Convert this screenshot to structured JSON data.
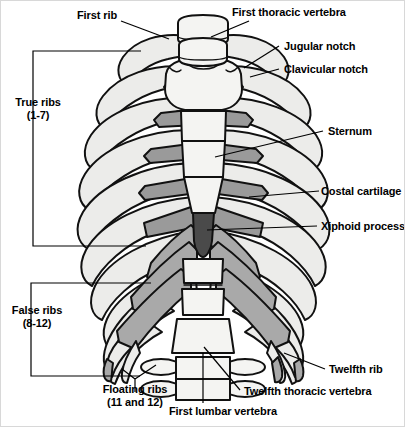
{
  "figure": {
    "background": "#ffffff",
    "border_color": "#d8d8d8"
  },
  "colors": {
    "outline": "#111111",
    "bone_fill": "#ececea",
    "bone_fill_light": "#f4f4f2",
    "cartilage_fill": "#a9a9a9",
    "cartilage_fill_dark": "#9a9a9a",
    "xiphoid_fill": "#4a4a4a",
    "leader_line": "#000000",
    "text": "#000000"
  },
  "labels": [
    {
      "id": "first-rib",
      "text": "First rib",
      "x": 76,
      "y": 8,
      "align": "left",
      "lines": [
        "First rib"
      ]
    },
    {
      "id": "first-thoracic-vertebra",
      "text": "First thoracic vertebra",
      "x": 231,
      "y": 5,
      "align": "left",
      "lines": [
        "First thoracic vertebra"
      ]
    },
    {
      "id": "jugular-notch",
      "text": "Jugular notch",
      "x": 283,
      "y": 39,
      "align": "left",
      "lines": [
        "Jugular notch"
      ]
    },
    {
      "id": "clavicular-notch",
      "text": "Clavicular notch",
      "x": 283,
      "y": 62,
      "align": "left",
      "lines": [
        "Clavicular notch"
      ]
    },
    {
      "id": "true-ribs",
      "text": "True ribs (1-7)",
      "x": 6,
      "y": 95,
      "align": "left",
      "lines": [
        "True ribs",
        "(1-7)"
      ]
    },
    {
      "id": "sternum",
      "text": "Sternum",
      "x": 327,
      "y": 124,
      "align": "left",
      "lines": [
        "Sternum"
      ]
    },
    {
      "id": "costal-cartilage",
      "text": "Costal cartilage",
      "x": 320,
      "y": 184,
      "align": "left",
      "lines": [
        "Costal cartilage"
      ]
    },
    {
      "id": "xiphoid-process",
      "text": "Xiphoid process",
      "x": 320,
      "y": 219,
      "align": "left",
      "lines": [
        "Xiphoid process"
      ]
    },
    {
      "id": "false-ribs",
      "text": "False ribs (8-12)",
      "x": 3,
      "y": 303,
      "align": "left",
      "lines": [
        "False ribs",
        "(8-12)"
      ]
    },
    {
      "id": "twelfth-rib",
      "text": "Twelfth rib",
      "x": 328,
      "y": 362,
      "align": "left",
      "lines": [
        "Twelfth rib"
      ]
    },
    {
      "id": "floating-ribs",
      "text": "Floating ribs (11 and 12)",
      "x": 82,
      "y": 382,
      "align": "left",
      "lines": [
        "Floating ribs",
        "(11 and 12)"
      ]
    },
    {
      "id": "twelfth-thoracic-vertebra",
      "text": "Twelfth thoracic vertebra",
      "x": 243,
      "y": 384,
      "align": "left",
      "lines": [
        "Twelfth thoracic vertebra"
      ]
    },
    {
      "id": "first-lumbar-vertebra",
      "text": "First lumbar vertebra",
      "x": 168,
      "y": 404,
      "align": "left",
      "lines": [
        "First lumbar vertebra"
      ]
    }
  ],
  "anatomy": {
    "rib_pairs": 12,
    "true_ribs_range": "1-7",
    "false_ribs_range": "8-12",
    "floating_ribs_range": "11 and 12",
    "sternum_parts": [
      "manubrium",
      "body",
      "xiphoid process"
    ],
    "vertebrae_shown": [
      "first thoracic vertebra",
      "twelfth thoracic vertebra",
      "first lumbar vertebra"
    ],
    "notches": [
      "jugular notch",
      "clavicular notch"
    ]
  }
}
